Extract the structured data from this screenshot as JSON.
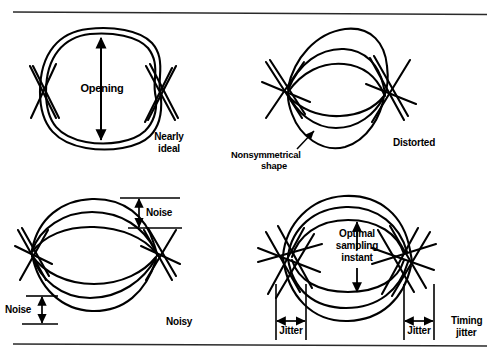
{
  "figure": {
    "title_rules": {
      "top": "horizontal-rule",
      "bottom": "horizontal-rule"
    },
    "stroke_color": "#000000",
    "background_color": "#ffffff"
  },
  "panels": [
    {
      "id": "nearly-ideal",
      "caption": "Nearly\nideal",
      "caption_line1": "Nearly",
      "caption_line2": "ideal",
      "annotations": [
        {
          "name": "opening",
          "text": "Opening",
          "arrow": "vertical-double"
        }
      ]
    },
    {
      "id": "distorted",
      "caption": "Distorted",
      "annotations": [
        {
          "name": "nonsymmetrical-shape",
          "text": "Nonsymmetrical\nshape",
          "line1": "Nonsymmetrical",
          "line2": "shape",
          "arrow": "leader-arrow"
        }
      ]
    },
    {
      "id": "noisy",
      "caption": "Noisy",
      "annotations": [
        {
          "name": "noise-top",
          "text": "Noise",
          "arrow": "vertical-double"
        },
        {
          "name": "noise-bottom",
          "text": "Noise",
          "arrow": "vertical-double"
        }
      ]
    },
    {
      "id": "timing-jitter",
      "caption": "Timing\njitter",
      "caption_line1": "Timing",
      "caption_line2": "jitter",
      "annotations": [
        {
          "name": "optimal-sampling-instant",
          "text": "Optimal\nsampling\ninstant",
          "line1": "Optimal",
          "line2": "sampling",
          "line3": "instant",
          "arrow": "vertical-double"
        },
        {
          "name": "jitter-left",
          "text": "Jitter",
          "arrow": "horizontal-double"
        },
        {
          "name": "jitter-right",
          "text": "Jitter",
          "arrow": "horizontal-double"
        }
      ]
    }
  ],
  "labels": {
    "opening": "Opening",
    "nearly_ideal_l1": "Nearly",
    "nearly_ideal_l2": "ideal",
    "nonsymmetrical_l1": "Nonsymmetrical",
    "nonsymmetrical_l2": "shape",
    "distorted": "Distorted",
    "noise_top": "Noise",
    "noise_bottom": "Noise",
    "noisy": "Noisy",
    "optimal_l1": "Optimal",
    "optimal_l2": "sampling",
    "optimal_l3": "instant",
    "jitter_left": "Jitter",
    "jitter_right": "Jitter",
    "timing_jitter_l1": "Timing",
    "timing_jitter_l2": "jitter"
  }
}
